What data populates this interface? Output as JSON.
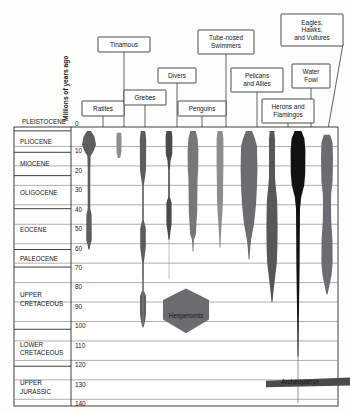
{
  "chart_data": {
    "type": "area",
    "title": "",
    "subtitle": "",
    "ylabel": "Millions of years ago",
    "xlabel": "",
    "ylim": [
      0,
      145
    ],
    "y_ticks": [
      0,
      10,
      20,
      30,
      40,
      50,
      60,
      70,
      80,
      90,
      100,
      110,
      120,
      130,
      140
    ],
    "grid": true,
    "legend_position": "none",
    "orientation": "vertical-inverted",
    "epochs": [
      {
        "name": "PLEISTOCENE",
        "top": 0,
        "bottom": 2,
        "outside_box": true
      },
      {
        "name": "PLIOCENE",
        "top": 2,
        "bottom": 13
      },
      {
        "name": "MIOCENE",
        "top": 13,
        "bottom": 25
      },
      {
        "name": "OLIGOCENE",
        "top": 25,
        "bottom": 42
      },
      {
        "name": "EOCENE",
        "top": 42,
        "bottom": 63
      },
      {
        "name": "PALEOCENE",
        "top": 63,
        "bottom": 72
      },
      {
        "name": "UPPER CRETACEOUS",
        "top": 72,
        "bottom": 104
      },
      {
        "name": "LOWER CRETACEOUS",
        "top": 104,
        "bottom": 123
      },
      {
        "name": "UPPER JURASSIC",
        "top": 123,
        "bottom": 145
      }
    ],
    "series": [
      {
        "name": "Ratites",
        "color": "#5d5d60",
        "cx": 89,
        "label_box": {
          "x": 82,
          "y": 101,
          "w": 42,
          "h": 15
        }
      },
      {
        "name": "Tinamous",
        "color": "#8d8d90",
        "cx": 119,
        "label_box": {
          "x": 98,
          "y": 37,
          "w": 52,
          "h": 15
        }
      },
      {
        "name": "Grebes",
        "color": "#5d5d60",
        "cx": 143,
        "label_box": {
          "x": 124,
          "y": 90,
          "w": 42,
          "h": 15
        }
      },
      {
        "name": "Divers",
        "color": "#4a4a4d",
        "cx": 169,
        "label_box": {
          "x": 158,
          "y": 68,
          "w": 38,
          "h": 15
        }
      },
      {
        "name": "Penguins",
        "color": "#77777a",
        "cx": 193,
        "label_box": {
          "x": 178,
          "y": 101,
          "w": 48,
          "h": 15
        }
      },
      {
        "name": "Tube-nosed Swimmers",
        "color": "#8d8d90",
        "cx": 220,
        "label_box": {
          "x": 198,
          "y": 30,
          "w": 56,
          "h": 24
        }
      },
      {
        "name": "Pelicans and Allies",
        "color": "#6c6c70",
        "cx": 249,
        "label_box": {
          "x": 231,
          "y": 68,
          "w": 52,
          "h": 24
        }
      },
      {
        "name": "Herons and Flamingos",
        "color": "#57575a",
        "cx": 272,
        "label_box": {
          "x": 262,
          "y": 99,
          "w": 52,
          "h": 24
        }
      },
      {
        "name": "Water Fowl",
        "color": "#121214",
        "cx": 298,
        "label_box": {
          "x": 292,
          "y": 64,
          "w": 38,
          "h": 24
        }
      },
      {
        "name": "Eagles, Hawks, and Vultures",
        "color": "#6c6c70",
        "cx": 327,
        "label_box": {
          "x": 281,
          "y": 14,
          "w": 62,
          "h": 32
        }
      }
    ],
    "annotations": [
      {
        "text": "Hesperornis",
        "x": 186,
        "y": 318,
        "color": "#6c6c70"
      },
      {
        "text": "Archeopteryx",
        "x": 300,
        "y": 384,
        "color": "#4a4a4d"
      }
    ]
  },
  "axis": {
    "vertical_label": "Millions of years ago"
  }
}
